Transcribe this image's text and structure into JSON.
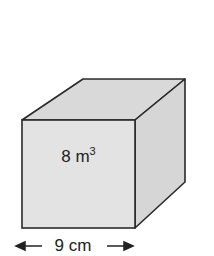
{
  "diagram": {
    "shape": "cube",
    "volume_value": "8 m",
    "volume_exponent": "3",
    "edge_label": "9 cm",
    "colors": {
      "face_front": "#e3e3e3",
      "face_top": "#d9d9d9",
      "face_side": "#d6d6d6",
      "stroke": "#2a2a2a"
    }
  }
}
